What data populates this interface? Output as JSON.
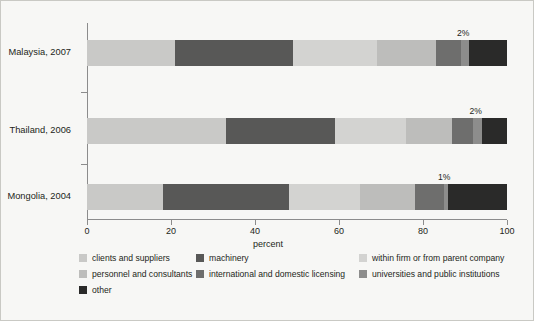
{
  "chart_data": {
    "type": "bar",
    "orientation": "horizontal",
    "stacked": true,
    "stack_mode": "percent",
    "title": "",
    "xlabel": "percent",
    "ylabel": "",
    "xlim": [
      0,
      100
    ],
    "xticks": [
      0,
      20,
      40,
      60,
      80,
      100
    ],
    "xtick_labels": [
      "0",
      "20",
      "40",
      "60",
      "80",
      "100"
    ],
    "grid": false,
    "legend_position": "bottom",
    "categories": [
      "Malaysia, 2007",
      "Thailand, 2006",
      "Mongolia, 2004"
    ],
    "series": [
      {
        "name": "clients and suppliers",
        "color": "#c9c9c7",
        "values": [
          21,
          33,
          18
        ]
      },
      {
        "name": "machinery",
        "color": "#585857",
        "values": [
          28,
          26,
          30
        ]
      },
      {
        "name": "within firm or from parent company",
        "color": "#d3d3d1",
        "values": [
          20,
          17,
          17
        ]
      },
      {
        "name": "personnel and consultants",
        "color": "#bdbdbb",
        "values": [
          14,
          11,
          13
        ]
      },
      {
        "name": "international and domestic licensing",
        "color": "#6e6e6d",
        "values": [
          6,
          5,
          7
        ]
      },
      {
        "name": "universities and public institutions",
        "color": "#8d8d8c",
        "values": [
          2,
          2,
          1
        ]
      },
      {
        "name": "other",
        "color": "#2a2a29",
        "values": [
          9,
          6,
          14
        ]
      }
    ],
    "annotations": [
      {
        "category": "Malaysia, 2007",
        "series": "universities and public institutions",
        "label": "2%"
      },
      {
        "category": "Thailand, 2006",
        "series": "universities and public institutions",
        "label": "2%"
      },
      {
        "category": "Mongolia, 2004",
        "series": "universities and public institutions",
        "label": "1%"
      }
    ]
  },
  "figure": {
    "background_color": "#f7f7f5",
    "border_color": "#c9c9c4",
    "axis_color": "#8c8c8c",
    "text_color": "#231f20"
  }
}
